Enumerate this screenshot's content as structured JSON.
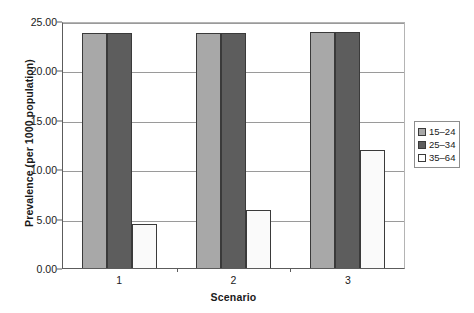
{
  "chart_data": {
    "type": "bar",
    "title": "",
    "xlabel": "Scenario",
    "ylabel": "Prevalence (per 1000 population)",
    "categories": [
      "1",
      "2",
      "3"
    ],
    "series": [
      {
        "name": "15–24",
        "color": "#a8a8a8",
        "values": [
          23.8,
          23.8,
          23.9
        ]
      },
      {
        "name": "25–34",
        "color": "#5d5d5d",
        "values": [
          23.8,
          23.8,
          23.9
        ]
      },
      {
        "name": "35–64",
        "color": "#ffffff",
        "values": [
          4.5,
          5.9,
          11.9
        ]
      }
    ],
    "ylim": [
      0.0,
      25.0
    ],
    "yticks": [
      "0.00",
      "5.00",
      "10.00",
      "15.00",
      "20.00",
      "25.00"
    ],
    "ytick_values": [
      0.0,
      5.0,
      10.0,
      15.0,
      20.0,
      25.0
    ],
    "grid": true,
    "legend_position": "right"
  }
}
